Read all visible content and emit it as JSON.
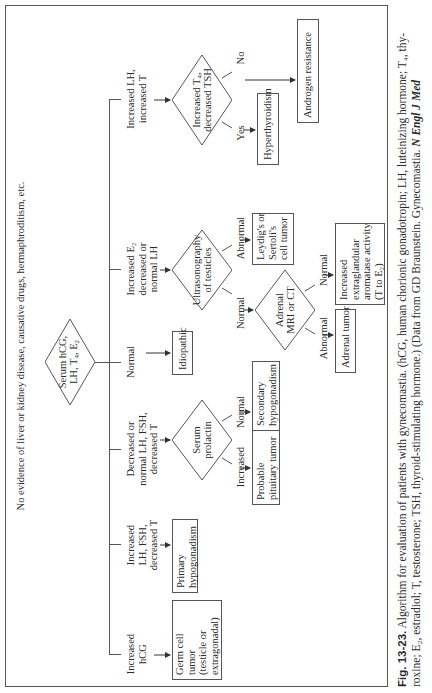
{
  "header_text": "No evidence of liver or kidney disease, causative drugs, hermaphroditism, etc.",
  "root_test": {
    "line1": "Serum hCG,",
    "line2": "LH, T",
    "sub4": "4",
    "mid": ", E",
    "sub2": "2"
  },
  "branches": [
    {
      "id": "hcg",
      "lines": [
        "Increased",
        "hCG"
      ]
    },
    {
      "id": "lh-fsh",
      "lines": [
        "Increased",
        "LH, FSH,",
        "decreased T"
      ]
    },
    {
      "id": "decreased",
      "lines": [
        "Decreased or",
        "normal LH, FSH,",
        "decreased T"
      ]
    },
    {
      "id": "normal",
      "lines": [
        "Normal"
      ]
    },
    {
      "id": "e2",
      "lines": [
        "Increased E₂",
        "decreased or",
        "normal LH"
      ]
    },
    {
      "id": "lh-t",
      "lines": [
        "Increased LH,",
        "increased T"
      ]
    }
  ],
  "decisions": {
    "prolactin": {
      "lines": [
        "Serum",
        "prolactin"
      ],
      "outcomes": [
        "Increased",
        "Normal"
      ]
    },
    "ultrasound": {
      "lines": [
        "Ultrasonography",
        "of testicles"
      ],
      "outcomes": [
        "Normal",
        "Abnormal"
      ]
    },
    "adrenal": {
      "lines": [
        "Adrenal",
        "MRI or CT"
      ],
      "outcomes": [
        "Abnormal",
        "Normal"
      ]
    },
    "thyroid": {
      "lines": [
        "Increased T₄,",
        "decreased TSH"
      ],
      "outcomes": [
        "Yes",
        "No"
      ]
    }
  },
  "results": {
    "germ_cell": [
      "Germ cell",
      "tumor",
      "(testicle or",
      "extragonadal)"
    ],
    "primary_hypo": [
      "Primary",
      "hypogonadism"
    ],
    "pituitary": [
      "Probable",
      "pituitary tumor"
    ],
    "secondary_hypo": [
      "Secondary",
      "hypogonadism"
    ],
    "idiopathic": [
      "Idiopathic"
    ],
    "leydig": [
      "Leydig's or",
      "Sertoli's",
      "cell tumor"
    ],
    "adrenal_tumor": [
      "Adrenal tumor"
    ],
    "aromatase": [
      "Increased",
      "extraglandular",
      "aromatase activity",
      "(T to E₂)"
    ],
    "hyperthyroidism": [
      "Hyperthyroidism"
    ],
    "androgen": [
      "Androgen resistance"
    ]
  },
  "caption": {
    "fig_label": "Fig. 13-23.",
    "line1": " Algorithm for evaluation of patients with gynecomastia. (hCG, human chorionic gonadotropin; LH, luteinizing hormone; T₄, thy-",
    "line2": "roxine; E₂, estradiol; T, testosterone; TSH, thyroid-stimulating hormone.) (Data from GD Braunstein. Gynecomastia. ",
    "journal": "N Engl J Med"
  }
}
